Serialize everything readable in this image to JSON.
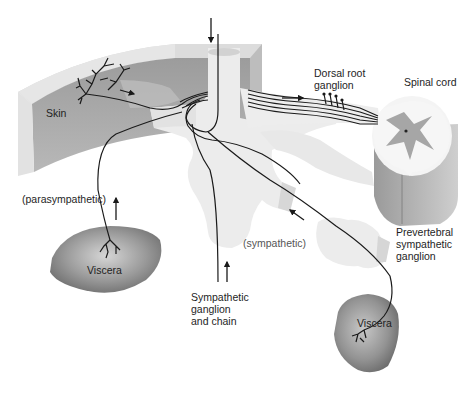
{
  "labels": {
    "skin": "Skin",
    "dorsal_root_ganglion": [
      "Dorsal root",
      "ganglion"
    ],
    "spinal_cord": "Spinal cord",
    "parasympathetic": "(parasympathetic)",
    "sympathetic": "(sympathetic)",
    "viscera_left": "Viscera",
    "viscera_right": "Viscera",
    "sympathetic_ganglion_chain": [
      "Sympathetic",
      "ganglion",
      "and chain"
    ],
    "prevertebral_ganglion": [
      "Prevertebral",
      "sympathetic",
      "ganglion"
    ]
  },
  "colors": {
    "skin_fill": "#a9a9a9",
    "skin_rim": "#d8d8d8",
    "ganglion_fill": "#ececec",
    "viscera_fill": "#8f8f8f",
    "nerve_stroke": "#1a1a1a",
    "grey_matter": "#a6a6a6"
  },
  "arrows": [
    {
      "name": "top-descending-arrow",
      "direction": "down"
    },
    {
      "name": "skin-afferent-arrow",
      "direction": "right"
    },
    {
      "name": "dorsal-root-arrow",
      "direction": "right"
    },
    {
      "name": "parasympathetic-arrow",
      "direction": "up"
    },
    {
      "name": "sympathetic-chain-arrow",
      "direction": "up"
    },
    {
      "name": "sympathetic-visceral-arrow",
      "direction": "up-left"
    }
  ]
}
